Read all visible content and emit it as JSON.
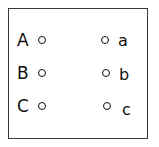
{
  "diagram": {
    "type": "matching-exercise",
    "border_color": "#3a3a3a",
    "text_color": "#101010",
    "background_color": "#ffffff",
    "left_column": {
      "items": [
        {
          "label": "A",
          "marker": "circle-bullet-icon"
        },
        {
          "label": "B",
          "marker": "circle-bullet-icon"
        },
        {
          "label": "C",
          "marker": "circle-bullet-icon"
        }
      ]
    },
    "right_column": {
      "items": [
        {
          "label": "a",
          "marker": "circle-bullet-icon"
        },
        {
          "label": "b",
          "marker": "circle-bullet-icon"
        },
        {
          "label": "c",
          "marker": "circle-bullet-icon"
        }
      ]
    }
  }
}
